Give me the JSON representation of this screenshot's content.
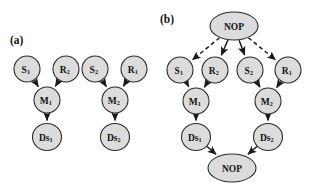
{
  "figure": {
    "background_color": "#ffffff",
    "node_fill_color": "#dcdcdc",
    "node_stroke_color": "#2b2b2b",
    "edge_color": "#1a1a1a",
    "label_color": "#111111"
  },
  "panels": [
    {
      "id": "a",
      "label": "(a)",
      "label_x": 10,
      "label_y": 40,
      "nodes": [
        {
          "id": "a_s1",
          "base": "S",
          "sub": "1",
          "cx": 27,
          "cy": 69,
          "rx": 13,
          "ry": 13,
          "font": 9.5
        },
        {
          "id": "a_r2",
          "base": "R",
          "sub": "2",
          "cx": 66,
          "cy": 69,
          "rx": 13,
          "ry": 13,
          "font": 9.5
        },
        {
          "id": "a_m1",
          "base": "M",
          "sub": "1",
          "cx": 47,
          "cy": 100,
          "rx": 13,
          "ry": 13,
          "font": 9.5
        },
        {
          "id": "a_ds1",
          "base": "Ds",
          "sub": "1",
          "cx": 47,
          "cy": 137,
          "rx": 14.5,
          "ry": 13.5,
          "font": 9.5
        },
        {
          "id": "a_s2",
          "base": "S",
          "sub": "2",
          "cx": 95,
          "cy": 69,
          "rx": 13,
          "ry": 13,
          "font": 9.5
        },
        {
          "id": "a_r1",
          "base": "R",
          "sub": "1",
          "cx": 134,
          "cy": 69,
          "rx": 13,
          "ry": 13,
          "font": 9.5
        },
        {
          "id": "a_m2",
          "base": "M",
          "sub": "2",
          "cx": 115,
          "cy": 100,
          "rx": 13,
          "ry": 13,
          "font": 9.5
        },
        {
          "id": "a_ds2",
          "base": "Ds",
          "sub": "2",
          "cx": 115,
          "cy": 137,
          "rx": 14.5,
          "ry": 13.5,
          "font": 9.5
        }
      ],
      "edges": [
        {
          "from": "a_s1",
          "to": "a_m1",
          "style": "solid"
        },
        {
          "from": "a_r2",
          "to": "a_m1",
          "style": "solid"
        },
        {
          "from": "a_m1",
          "to": "a_ds1",
          "style": "solid"
        },
        {
          "from": "a_s2",
          "to": "a_m2",
          "style": "solid"
        },
        {
          "from": "a_r1",
          "to": "a_m2",
          "style": "solid"
        },
        {
          "from": "a_m2",
          "to": "a_ds2",
          "style": "solid"
        }
      ]
    },
    {
      "id": "b",
      "label": "(b)",
      "label_x": 160,
      "label_y": 19,
      "nodes": [
        {
          "id": "b_nop_top",
          "base": "NOP",
          "sub": "",
          "cx": 234,
          "cy": 26,
          "rx": 24,
          "ry": 14,
          "font": 9.5
        },
        {
          "id": "b_s1",
          "base": "S",
          "sub": "1",
          "cx": 180,
          "cy": 70,
          "rx": 13,
          "ry": 13,
          "font": 9.5
        },
        {
          "id": "b_r2",
          "base": "R",
          "sub": "2",
          "cx": 215,
          "cy": 70,
          "rx": 13,
          "ry": 13,
          "font": 9.5
        },
        {
          "id": "b_s2",
          "base": "S",
          "sub": "2",
          "cx": 250,
          "cy": 70,
          "rx": 13,
          "ry": 13,
          "font": 9.5
        },
        {
          "id": "b_r1",
          "base": "R",
          "sub": "1",
          "cx": 288,
          "cy": 70,
          "rx": 13,
          "ry": 13,
          "font": 9.5
        },
        {
          "id": "b_m1",
          "base": "M",
          "sub": "1",
          "cx": 196,
          "cy": 101,
          "rx": 13,
          "ry": 13,
          "font": 9.5
        },
        {
          "id": "b_m2",
          "base": "M",
          "sub": "2",
          "cx": 268,
          "cy": 101,
          "rx": 13,
          "ry": 13,
          "font": 9.5
        },
        {
          "id": "b_ds1",
          "base": "Ds",
          "sub": "1",
          "cx": 196,
          "cy": 137,
          "rx": 14.5,
          "ry": 13.5,
          "font": 9.5
        },
        {
          "id": "b_ds2",
          "base": "Ds",
          "sub": "2",
          "cx": 268,
          "cy": 137,
          "rx": 14.5,
          "ry": 13.5,
          "font": 9.5
        },
        {
          "id": "b_nop_bot",
          "base": "NOP",
          "sub": "",
          "cx": 232,
          "cy": 168,
          "rx": 24,
          "ry": 14,
          "font": 9.5
        }
      ],
      "edges": [
        {
          "from": "b_nop_top",
          "to": "b_s1",
          "style": "dashed"
        },
        {
          "from": "b_nop_top",
          "to": "b_r2",
          "style": "solid"
        },
        {
          "from": "b_nop_top",
          "to": "b_s2",
          "style": "solid"
        },
        {
          "from": "b_nop_top",
          "to": "b_r1",
          "style": "dashed"
        },
        {
          "from": "b_s1",
          "to": "b_m1",
          "style": "solid"
        },
        {
          "from": "b_r2",
          "to": "b_m1",
          "style": "solid"
        },
        {
          "from": "b_s2",
          "to": "b_m2",
          "style": "solid"
        },
        {
          "from": "b_r1",
          "to": "b_m2",
          "style": "solid"
        },
        {
          "from": "b_m1",
          "to": "b_ds1",
          "style": "solid"
        },
        {
          "from": "b_m2",
          "to": "b_ds2",
          "style": "solid"
        },
        {
          "from": "b_ds1",
          "to": "b_nop_bot",
          "style": "solid"
        },
        {
          "from": "b_ds2",
          "to": "b_nop_bot",
          "style": "solid"
        }
      ]
    }
  ]
}
